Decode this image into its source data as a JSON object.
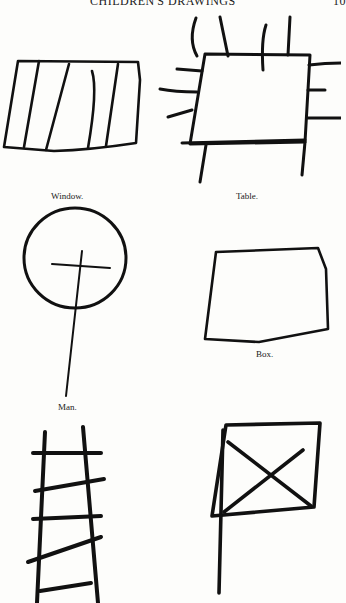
{
  "page": {
    "running_head": "CHILDREN'S DRAWINGS",
    "page_number": "10"
  },
  "figures": [
    {
      "id": "window",
      "caption": "Window."
    },
    {
      "id": "table",
      "caption": "Table."
    },
    {
      "id": "man",
      "caption": "Man."
    },
    {
      "id": "box",
      "caption": "Box."
    },
    {
      "id": "ladder",
      "caption": ""
    },
    {
      "id": "flag",
      "caption": ""
    }
  ],
  "colors": {
    "paper": "#fdfdfb",
    "ink": "#111111"
  }
}
